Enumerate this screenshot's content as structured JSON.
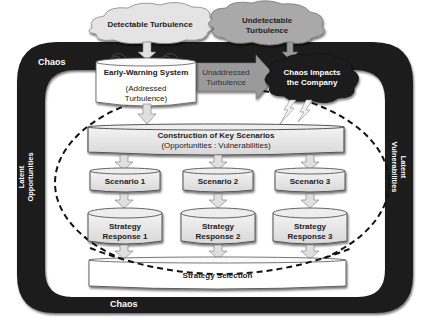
{
  "diagram": {
    "frame": {
      "top_label": "Chaos",
      "bottom_label": "Chaos",
      "left_label_line1": "Latent",
      "left_label_line2": "Opportunities",
      "right_label_line1": "Latent",
      "right_label_line2": "Vulnerabilities"
    },
    "clouds": {
      "detectable": "Detectable Turbulence",
      "undetectable_line1": "Undetectable",
      "undetectable_line2": "Turbulence",
      "chaos_impacts_line1": "Chaos Impacts",
      "chaos_impacts_line2": "the Company"
    },
    "early_warning": {
      "title": "Early-Warning System",
      "sub_line1": "(Addressed",
      "sub_line2": "Turbulence)"
    },
    "unaddressed_arrow": {
      "line1": "Unaddressed",
      "line2": "Turbulence"
    },
    "construction": {
      "title": "Construction of Key Scenarios",
      "subtitle": "(Opportunities : Vulnerabilities)"
    },
    "scenarios": [
      {
        "label": "Scenario 1",
        "response_line1": "Strategy",
        "response_line2": "Response 1"
      },
      {
        "label": "Scenario 2",
        "response_line1": "Strategy",
        "response_line2": "Response 2"
      },
      {
        "label": "Scenario 3",
        "response_line1": "Strategy",
        "response_line2": "Response 3"
      }
    ],
    "selection": "Strategy Selection",
    "colors": {
      "frame": "#1c1c1c",
      "cloud_light": "#e4e4e4",
      "cloud_mid": "#a9a9a9",
      "cloud_dark": "#1e1e1e",
      "box_fill": "#e9e9e9",
      "arrow_fill": "#e0e0e0",
      "unaddressed_arrow": "#9a9a9a"
    }
  }
}
